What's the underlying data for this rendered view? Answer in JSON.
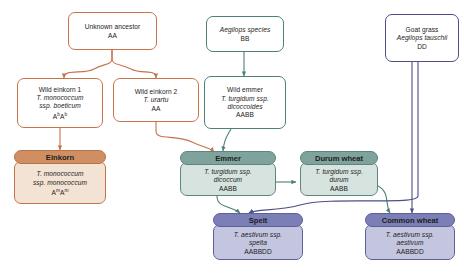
{
  "diagram": {
    "colors": {
      "a_genome_line": "#c8724b",
      "b_genome_line": "#4e7f78",
      "d_genome_line": "#4b4f86",
      "einkorn_header": "#d08f63",
      "emmer_header": "#7fa39c",
      "spelt_header": "#7b7fb5",
      "background": "#ffffff"
    },
    "nodes": [
      {
        "id": "unknown-ancestor",
        "style": "plain-orange",
        "lines": [
          {
            "text": "Unknown ancestor",
            "italic": false
          },
          {
            "text": "AA",
            "italic": false
          }
        ]
      },
      {
        "id": "wild-einkorn-1",
        "style": "plain-orange",
        "lines": [
          {
            "text": "Wild einkorn 1",
            "italic": false
          },
          {
            "text": "T. monococcum",
            "italic": true
          },
          {
            "text": "ssp. boeticum",
            "italic": true
          },
          {
            "text": "AbAb",
            "italic": false
          }
        ]
      },
      {
        "id": "wild-einkorn-2",
        "style": "plain-orange",
        "lines": [
          {
            "text": "Wild einkorn 2",
            "italic": false
          },
          {
            "text": "T. urartu",
            "italic": true
          },
          {
            "text": "AA",
            "italic": false
          }
        ]
      },
      {
        "id": "aegilops-species",
        "style": "plain-teal",
        "lines": [
          {
            "text": "Aegilops species",
            "italic": true
          },
          {
            "text": "BB",
            "italic": false
          }
        ]
      },
      {
        "id": "wild-emmer",
        "style": "plain-teal",
        "lines": [
          {
            "text": "Wild emmer",
            "italic": false
          },
          {
            "text": "T. turgidum ssp.",
            "italic": true
          },
          {
            "text": "dicoccoides",
            "italic": true
          },
          {
            "text": "AABB",
            "italic": false
          }
        ]
      },
      {
        "id": "goat-grass",
        "style": "plain-navy",
        "lines": [
          {
            "text": "Goat grass",
            "italic": false
          },
          {
            "text": "Aegilops tauschii",
            "italic": true
          },
          {
            "text": "DD",
            "italic": false
          }
        ]
      },
      {
        "id": "einkorn",
        "style": "card-orange",
        "header": "Einkorn",
        "lines": [
          {
            "text": "T. monococcum",
            "italic": true
          },
          {
            "text": "ssp. monococcum",
            "italic": true
          },
          {
            "text": "AmAm",
            "italic": false
          }
        ]
      },
      {
        "id": "emmer",
        "style": "card-teal",
        "header": "Emmer",
        "lines": [
          {
            "text": "T. turgidum ssp.",
            "italic": true
          },
          {
            "text": "dicoccum",
            "italic": true
          },
          {
            "text": "AABB",
            "italic": false
          }
        ]
      },
      {
        "id": "durum-wheat",
        "style": "card-teal",
        "header": "Durum wheat",
        "lines": [
          {
            "text": "T. turgidum ssp.",
            "italic": true
          },
          {
            "text": "durum",
            "italic": true
          },
          {
            "text": "AABB",
            "italic": false
          }
        ]
      },
      {
        "id": "spelt",
        "style": "card-purple",
        "header": "Spelt",
        "lines": [
          {
            "text": "T. aestivum ssp.",
            "italic": true
          },
          {
            "text": "spelta",
            "italic": true
          },
          {
            "text": "AABBDD",
            "italic": false
          }
        ]
      },
      {
        "id": "common-wheat",
        "style": "card-purple",
        "header": "Common wheat",
        "lines": [
          {
            "text": "T. aestivum ssp.",
            "italic": true
          },
          {
            "text": "aestivum",
            "italic": true
          },
          {
            "text": "AABBDD",
            "italic": false
          }
        ]
      }
    ],
    "edges": [
      {
        "from": "unknown-ancestor",
        "to": "wild-einkorn-1",
        "color": "#c8724b"
      },
      {
        "from": "unknown-ancestor",
        "to": "wild-einkorn-2",
        "color": "#c8724b"
      },
      {
        "from": "wild-einkorn-1",
        "to": "einkorn",
        "color": "#c8724b"
      },
      {
        "from": "wild-einkorn-2",
        "to": "wild-emmer",
        "color": "#c8724b"
      },
      {
        "from": "aegilops-species",
        "to": "wild-emmer",
        "color": "#4e7f78"
      },
      {
        "from": "wild-emmer",
        "to": "emmer",
        "color": "#4e7f78"
      },
      {
        "from": "emmer",
        "to": "durum-wheat",
        "color": "#4e7f78"
      },
      {
        "from": "emmer",
        "to": "spelt",
        "color": "#4e7f78"
      },
      {
        "from": "durum-wheat",
        "to": "common-wheat",
        "color": "#4e7f78"
      },
      {
        "from": "goat-grass",
        "to": "spelt",
        "color": "#4b4f86"
      },
      {
        "from": "goat-grass",
        "to": "common-wheat",
        "color": "#4b4f86"
      }
    ]
  }
}
